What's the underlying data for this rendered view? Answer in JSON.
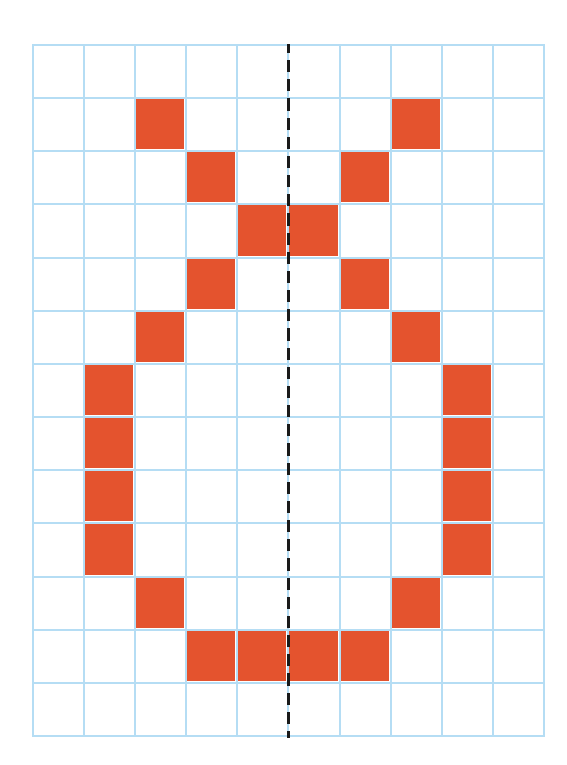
{
  "figure": {
    "grid": {
      "columns": 10,
      "rows": 13,
      "line_color": "#B5DDF4",
      "fill_color": "#E4532E",
      "background": "#FFFFFF"
    },
    "axis_of_symmetry": {
      "style": "dashed",
      "color": "#1A1A1A",
      "position": "between column 5 and column 6"
    },
    "filled_cells": [
      [
        1,
        2
      ],
      [
        1,
        7
      ],
      [
        2,
        3
      ],
      [
        2,
        6
      ],
      [
        3,
        4
      ],
      [
        3,
        5
      ],
      [
        4,
        3
      ],
      [
        4,
        6
      ],
      [
        5,
        2
      ],
      [
        5,
        7
      ],
      [
        6,
        1
      ],
      [
        6,
        8
      ],
      [
        7,
        1
      ],
      [
        7,
        8
      ],
      [
        8,
        1
      ],
      [
        8,
        8
      ],
      [
        9,
        1
      ],
      [
        9,
        8
      ],
      [
        10,
        2
      ],
      [
        10,
        7
      ],
      [
        11,
        3
      ],
      [
        11,
        4
      ],
      [
        11,
        5
      ],
      [
        11,
        6
      ]
    ]
  }
}
